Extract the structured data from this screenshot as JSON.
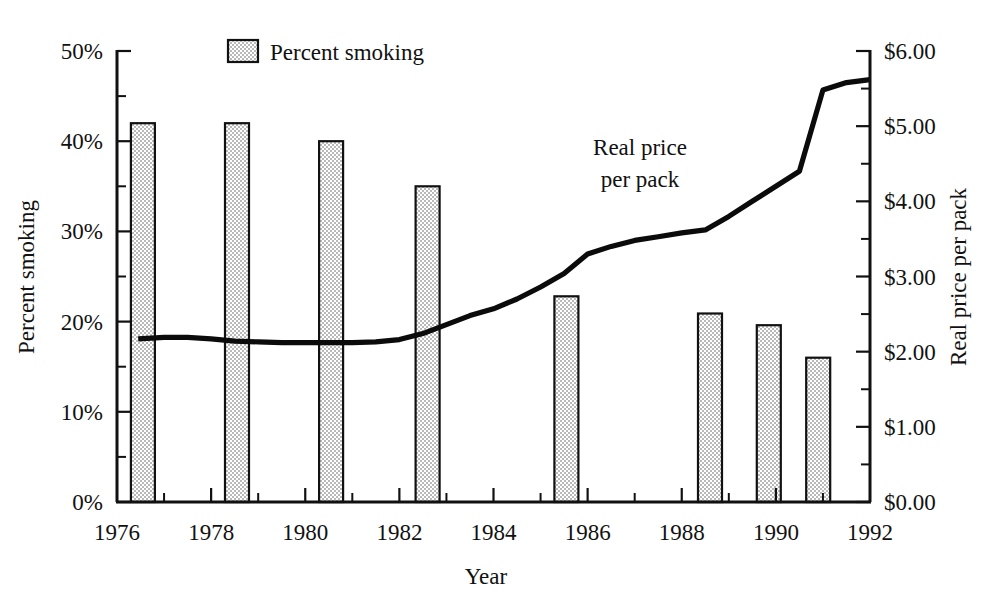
{
  "chart_data": {
    "type": "bar",
    "title": "",
    "subtitle": "",
    "xlabel": "Year",
    "ylabel": "Percent smoking",
    "y2label": "Real price per pack",
    "xlim": [
      1976,
      1992
    ],
    "ylim": [
      0,
      50
    ],
    "y2lim": [
      0,
      6
    ],
    "grid": false,
    "legend_position": "top-center",
    "x_ticks": [
      "1976",
      "1978",
      "1980",
      "1982",
      "1984",
      "1986",
      "1988",
      "1990",
      "1992"
    ],
    "x_tick_values": [
      1976,
      1978,
      1980,
      1982,
      1984,
      1986,
      1988,
      1990,
      1992
    ],
    "x_minor_tick_values": [
      1977,
      1979,
      1981,
      1983,
      1985,
      1987,
      1989,
      1991
    ],
    "y_ticks": [
      "0%",
      "10%",
      "20%",
      "30%",
      "40%",
      "50%"
    ],
    "y_tick_values": [
      0,
      10,
      20,
      30,
      40,
      50
    ],
    "y_minor_tick_values": [
      5,
      15,
      25,
      35,
      45
    ],
    "y2_ticks": [
      "$0.00",
      "$1.00",
      "$2.00",
      "$3.00",
      "$4.00",
      "$5.00",
      "$6.00"
    ],
    "y2_tick_values": [
      0,
      1,
      2,
      3,
      4,
      5,
      6
    ],
    "y2_minor_tick_values": [
      0.5,
      1.5,
      2.5,
      3.5,
      4.5,
      5.5
    ],
    "annotations": [
      {
        "text_line1": "Real price",
        "text_line2": "per pack",
        "x": 1986.0,
        "y2": 4.85
      }
    ],
    "series": [
      {
        "name": "Percent smoking",
        "type": "bar",
        "axis": "left",
        "color": "#d0d0d0",
        "edge_color": "#111111",
        "x": [
          1976.55,
          1978.55,
          1980.55,
          1982.6,
          1985.55,
          1988.6,
          1989.85,
          1990.9
        ],
        "values": [
          42,
          42,
          40,
          35,
          22.8,
          20.9,
          19.6,
          16.0
        ]
      },
      {
        "name": "Real price per pack",
        "type": "line",
        "axis": "right",
        "color": "#0b0b0b",
        "x": [
          1976.45,
          1977.0,
          1977.5,
          1978.0,
          1978.5,
          1979.0,
          1979.5,
          1980.0,
          1980.5,
          1981.0,
          1981.5,
          1982.0,
          1982.5,
          1983.0,
          1983.5,
          1984.0,
          1984.5,
          1985.0,
          1985.5,
          1986.0,
          1986.5,
          1987.0,
          1987.5,
          1988.0,
          1988.5,
          1989.0,
          1989.5,
          1990.0,
          1990.5,
          1991.0,
          1991.5,
          1992.0
        ],
        "values": [
          2.17,
          2.19,
          2.19,
          2.17,
          2.14,
          2.13,
          2.12,
          2.12,
          2.12,
          2.12,
          2.13,
          2.16,
          2.24,
          2.36,
          2.48,
          2.57,
          2.7,
          2.86,
          3.04,
          3.3,
          3.4,
          3.48,
          3.53,
          3.58,
          3.62,
          3.8,
          4.0,
          4.2,
          4.4,
          5.48,
          5.58,
          5.62
        ]
      }
    ],
    "legend": [
      {
        "label": "Percent smoking",
        "swatch_color": "#d0d0d0",
        "swatch_edge": "#111111"
      }
    ]
  },
  "axes": {
    "x_title": "Year",
    "y_left_title": "Percent smoking",
    "y_right_title": "Real price per pack"
  }
}
